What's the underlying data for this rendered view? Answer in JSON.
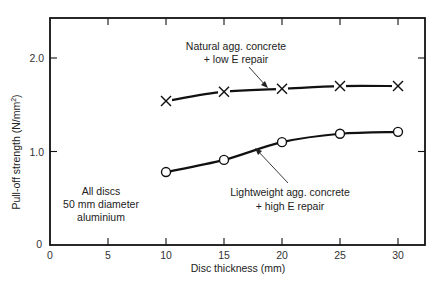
{
  "chart_data": {
    "type": "line",
    "title": "",
    "xlabel": "Disc thickness (mm)",
    "ylabel": "Pull-off strength (N/mm²)",
    "ylabel_main": "Pull-off strength (N/mm",
    "ylabel_sup": "2",
    "ylabel_close": ")",
    "xlim": [
      0,
      32.5
    ],
    "ylim": [
      0,
      2.45
    ],
    "xticks": [
      0,
      5,
      10,
      15,
      20,
      25,
      30
    ],
    "xtick_labels": [
      "0",
      "5",
      "10",
      "15",
      "20",
      "25",
      "30"
    ],
    "yticks": [
      0,
      1.0,
      2.0
    ],
    "ytick_labels": [
      "0",
      "1.0",
      "2.0"
    ],
    "grid": false,
    "legend": "none (inline annotations)",
    "x": [
      10,
      15,
      20,
      25,
      30
    ],
    "series": [
      {
        "name": "Natural agg. concrete + low E repair",
        "marker": "x",
        "values": [
          1.54,
          1.64,
          1.67,
          1.7,
          1.7
        ]
      },
      {
        "name": "Lightweight agg. concrete + high E repair",
        "marker": "o",
        "values": [
          0.78,
          0.91,
          1.1,
          1.19,
          1.21
        ]
      }
    ],
    "annotations": [
      {
        "lines": [
          "Natural agg. concrete",
          "+ low E repair"
        ],
        "points_to": "upper curve"
      },
      {
        "lines": [
          "Lightweight agg. concrete",
          "+ high E repair"
        ],
        "points_to": "lower curve"
      },
      {
        "lines": [
          "All discs",
          "50 mm diameter",
          "aluminium"
        ]
      }
    ]
  }
}
